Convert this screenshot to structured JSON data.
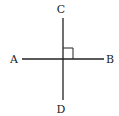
{
  "diagram": {
    "labels": {
      "top": "C",
      "left": "A",
      "right": "B",
      "bottom": "D"
    },
    "line_color": "#222222"
  }
}
